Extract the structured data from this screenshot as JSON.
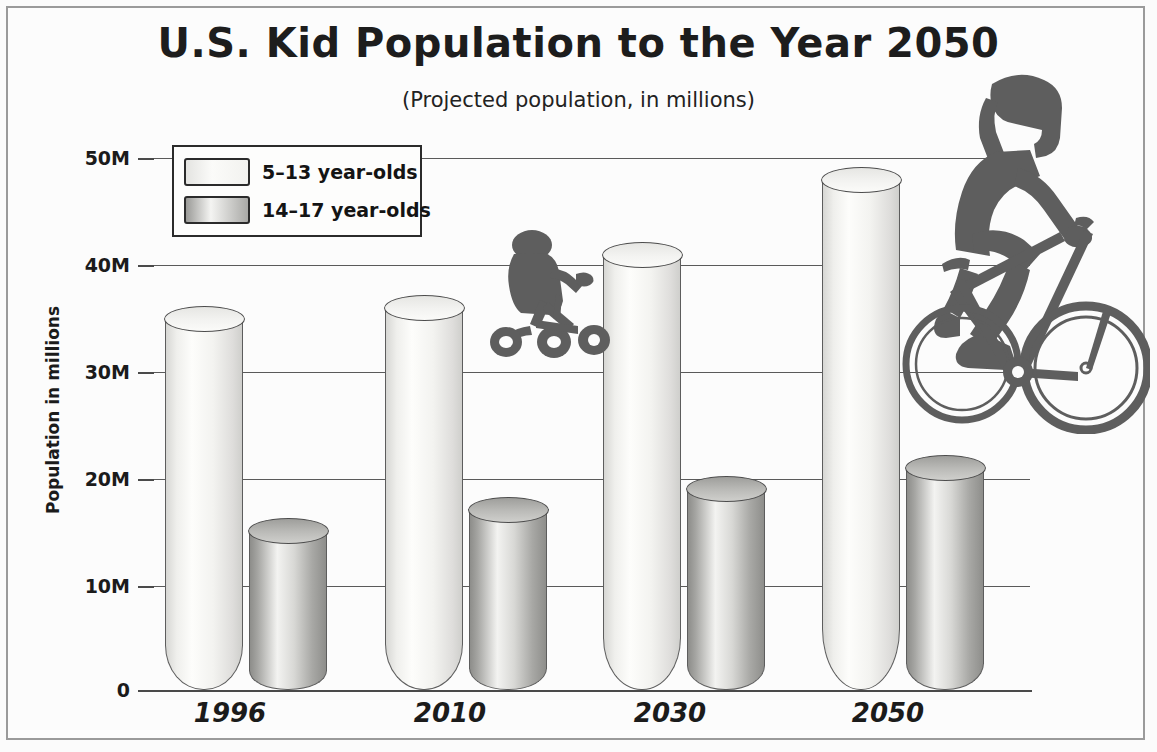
{
  "chart_data": {
    "type": "bar",
    "title": "U.S. Kid Population to the Year 2050",
    "subtitle": "(Projected population, in millions)",
    "xlabel": "",
    "ylabel": "Population in millions",
    "categories": [
      "1996",
      "2010",
      "2030",
      "2050"
    ],
    "series": [
      {
        "name": "5–13 year-olds",
        "values": [
          35,
          36,
          41,
          48
        ],
        "color": "#f5f5f2"
      },
      {
        "name": "14–17 year-olds",
        "values": [
          15,
          17,
          19,
          21
        ],
        "color": "#a9a9a6"
      }
    ],
    "ylim": [
      0,
      50
    ],
    "yticks": [
      0,
      10,
      20,
      30,
      40,
      50
    ],
    "ytick_labels": [
      "0",
      "10M",
      "20M",
      "30M",
      "40M",
      "50M"
    ],
    "grid": true,
    "legend_position": "upper-left-inside",
    "annotations": [
      {
        "name": "toddler-on-tricycle-silhouette",
        "note": "dark gray silhouette of a small child riding a tricycle, over the 2010 group"
      },
      {
        "name": "teen-on-bicycle-silhouette",
        "note": "dark gray silhouette of a teenager riding a bicycle, over the 2050 group"
      }
    ]
  },
  "colors": {
    "frame": "#9a9a9a",
    "background": "#fbfbfb",
    "axis": "#4a4a4a",
    "gridline": "#5a5a5a",
    "text": "#1b1b1b",
    "silhouette": "#5e5e5e"
  }
}
